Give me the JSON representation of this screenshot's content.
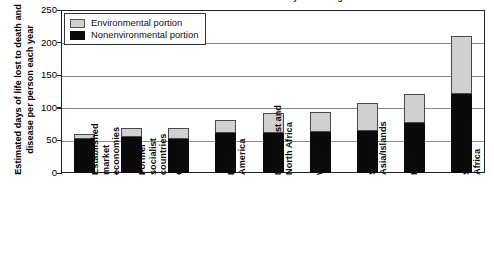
{
  "chart_data": {
    "type": "bar",
    "stacked": true,
    "title": "Environmental Burden by World Region",
    "xlabel": "",
    "ylabel": "Estimated days of life lost to death and disease per person each year",
    "ylim": [
      0,
      250
    ],
    "yticks": [
      0,
      50,
      100,
      150,
      200,
      250
    ],
    "grid": true,
    "legend_position": "top-left",
    "categories": [
      "Established market economies",
      "Former socialist countries",
      "China",
      "Latin America",
      "Middle East and North Africa",
      "World",
      "Southeast Asia/Islands",
      "India",
      "Sub-Saharan Africa"
    ],
    "category_lines": [
      [
        "Established",
        "market",
        "economies"
      ],
      [
        "Former",
        "socialist",
        "countries"
      ],
      [
        "China"
      ],
      [
        "Latin",
        "America"
      ],
      [
        "Middle East and",
        "North Africa"
      ],
      [
        "World"
      ],
      [
        "Southeast",
        "Asia/Islands"
      ],
      [
        "India"
      ],
      [
        "Sub-Saharan",
        "Africa"
      ]
    ],
    "series": [
      {
        "name": "Nonenvironmental portion",
        "color": "#0a0a0a",
        "values": [
          52,
          55,
          52,
          61,
          61,
          63,
          64,
          77,
          121
        ]
      },
      {
        "name": "Environmental portion",
        "color": "#d0d0d0",
        "values": [
          8,
          14,
          17,
          20,
          31,
          31,
          43,
          44,
          89
        ]
      }
    ],
    "totals": [
      60,
      69,
      69,
      81,
      92,
      94,
      107,
      121,
      210
    ]
  },
  "legend": {
    "items": [
      {
        "label": "Environmental portion",
        "swatch": "env"
      },
      {
        "label": "Nonenvironmental portion",
        "swatch": "nonenv"
      }
    ]
  },
  "axis": {
    "y_title": "Estimated days of life lost to death and disease per person each year",
    "y_tick_labels": [
      "250",
      "200",
      "150",
      "100",
      "50",
      "0"
    ]
  }
}
